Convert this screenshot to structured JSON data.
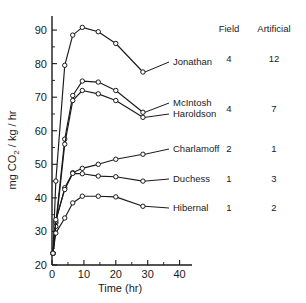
{
  "chart_data": {
    "type": "line",
    "title": "",
    "xlabel": "Time (hr)",
    "ylabel": "mg CO2 / kg / hr",
    "ylabel_parts": {
      "prefix": "mg CO",
      "subscript": "2",
      "suffix": " / kg / hr"
    },
    "xlim": [
      0,
      42
    ],
    "ylim": [
      20,
      93
    ],
    "xticks": [
      0,
      10,
      20,
      30,
      40
    ],
    "xtick_labels": [
      "0",
      "10",
      "20",
      "30",
      "40"
    ],
    "xminor_ticks": [
      5,
      15,
      25,
      35
    ],
    "yticks": [
      20,
      30,
      40,
      50,
      60,
      70,
      80,
      90
    ],
    "ytick_labels": [
      "20",
      "30",
      "40",
      "50",
      "60",
      "70",
      "80",
      "90"
    ],
    "grid": false,
    "legend_position": "right-outside",
    "marker": "open-circle",
    "series": [
      {
        "name": "Jonathan",
        "field": "4",
        "artificial": "12",
        "x": [
          0.3,
          1.2,
          4.0,
          6.5,
          9.5,
          14.5,
          20.0,
          28.5
        ],
        "y": [
          23.5,
          45.0,
          79.5,
          88.5,
          90.8,
          89.5,
          86.0,
          77.5
        ]
      },
      {
        "name": "McIntosh",
        "field": "4",
        "artificial": "7",
        "x": [
          0.3,
          1.2,
          4.0,
          6.5,
          9.5,
          14.5,
          20.0,
          28.5
        ],
        "y": [
          23.5,
          32.5,
          57.5,
          70.5,
          74.8,
          74.5,
          72.0,
          65.5
        ]
      },
      {
        "name": "Haroldson",
        "field": "",
        "artificial": "",
        "x": [
          0.3,
          1.2,
          4.0,
          6.5,
          9.5,
          14.5,
          20.0,
          28.5
        ],
        "y": [
          23.5,
          31.5,
          56.0,
          69.0,
          72.0,
          71.0,
          69.0,
          64.0
        ]
      },
      {
        "name": "Charlamoff",
        "field": "2",
        "artificial": "1",
        "x": [
          0.3,
          1.2,
          4.0,
          6.5,
          9.5,
          14.5,
          20.0,
          28.5
        ],
        "y": [
          23.5,
          33.0,
          43.0,
          47.5,
          48.8,
          50.0,
          51.5,
          53.0
        ]
      },
      {
        "name": "Duchess",
        "field": "1",
        "artificial": "3",
        "x": [
          0.3,
          1.2,
          4.0,
          6.5,
          9.5,
          14.5,
          20.0,
          28.5
        ],
        "y": [
          23.5,
          33.5,
          42.5,
          47.3,
          47.2,
          46.5,
          46.3,
          45.0
        ]
      },
      {
        "name": "Hibernal",
        "field": "1",
        "artificial": "2",
        "x": [
          0.3,
          1.2,
          4.0,
          6.5,
          9.5,
          14.5,
          20.0,
          28.5
        ],
        "y": [
          23.5,
          29.5,
          34.0,
          38.5,
          40.5,
          40.5,
          40.3,
          37.5
        ]
      }
    ],
    "annotations": [
      {
        "name": "Jonathan",
        "label": "Jonathan",
        "anchor_x": 28.5,
        "anchor_y": 77.5,
        "label_x": 173,
        "label_y": 65
      },
      {
        "name": "McIntosh",
        "label": "McIntosh",
        "anchor_x": 28.5,
        "anchor_y": 65.5,
        "label_x": 173,
        "label_y": 106
      },
      {
        "name": "Haroldson",
        "label": "Haroldson",
        "anchor_x": 28.5,
        "anchor_y": 64.0,
        "label_x": 173,
        "label_y": 117
      },
      {
        "name": "Charlamoff",
        "label": "Charlamoff",
        "anchor_x": 28.5,
        "anchor_y": 53.0,
        "label_x": 173,
        "label_y": 152
      },
      {
        "name": "Duchess",
        "label": "Duchess",
        "anchor_x": 28.5,
        "anchor_y": 45.0,
        "label_x": 173,
        "label_y": 182
      },
      {
        "name": "Hibernal",
        "label": "Hibernal",
        "anchor_x": 28.5,
        "anchor_y": 37.5,
        "label_x": 173,
        "label_y": 211
      }
    ]
  },
  "legend_table": {
    "headers": {
      "col1": "Field",
      "col2": "Artificial"
    },
    "header_x": {
      "col1": 229,
      "col2": 274
    },
    "header_y": 32,
    "rows": [
      {
        "name": "Jonathan",
        "field": "4",
        "artificial": "12",
        "y": 62
      },
      {
        "name": "McIntosh-Haroldson",
        "field": "4",
        "artificial": "7",
        "y": 112
      },
      {
        "name": "Charlamoff",
        "field": "2",
        "artificial": "1",
        "y": 152
      },
      {
        "name": "Duchess",
        "field": "1",
        "artificial": "3",
        "y": 182
      },
      {
        "name": "Hibernal",
        "field": "1",
        "artificial": "2",
        "y": 211
      }
    ]
  },
  "axes": {
    "x_axis_title": "Time (hr)",
    "y_axis_title_prefix": "mg CO",
    "y_axis_title_sub": "2",
    "y_axis_title_suffix": " / kg / hr"
  }
}
